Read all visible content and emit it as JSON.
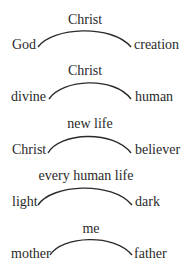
{
  "diagram": {
    "rows": [
      {
        "top": "Christ",
        "left": "God",
        "right": "creation"
      },
      {
        "top": "Christ",
        "left": "divine",
        "right": "human"
      },
      {
        "top": "new life",
        "left": "Christ",
        "right": "believer"
      },
      {
        "top": "every human life",
        "left": "light",
        "right": "dark"
      },
      {
        "top": "me",
        "left": "mother",
        "right": "father"
      }
    ]
  }
}
